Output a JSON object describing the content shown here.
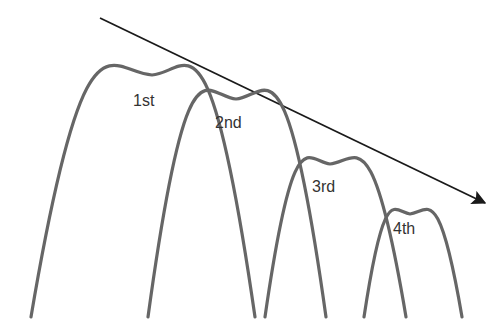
{
  "diagram": {
    "arrow": {
      "from": [
        100,
        18
      ],
      "to": [
        485,
        203
      ],
      "color": "#1a1a1a"
    },
    "curve_color": "#666666",
    "curves": [
      {
        "label": "1st",
        "left_x": 31,
        "peak": [
          152,
          75
        ],
        "right_x": 255,
        "label_pos": [
          133,
          106
        ]
      },
      {
        "label": "2nd",
        "left_x": 148,
        "peak": [
          236,
          99
        ],
        "right_x": 326,
        "label_pos": [
          215,
          128
        ]
      },
      {
        "label": "3rd",
        "left_x": 265,
        "peak": [
          330,
          164
        ],
        "right_x": 406,
        "label_pos": [
          312,
          192
        ]
      },
      {
        "label": "4th",
        "left_x": 364,
        "peak": [
          410,
          214
        ],
        "right_x": 462,
        "label_pos": [
          393,
          234
        ]
      }
    ],
    "baseline_y": 317
  }
}
